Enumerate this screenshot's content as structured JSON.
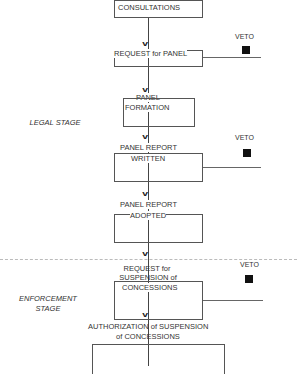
{
  "diagram": {
    "stages": [
      {
        "label": "LEGAL STAGE"
      },
      {
        "label_line1": "ENFORCEMENT",
        "label_line2": "STAGE"
      }
    ],
    "steps": [
      {
        "label": "CONSULTATIONS"
      },
      {
        "label": "REQUEST for PANEL"
      },
      {
        "label_line1": "PANEL",
        "label_line2": "FORMATION"
      },
      {
        "label_line1": "PANEL REPORT",
        "label_line2": "WRITTEN"
      },
      {
        "label_line1": "PANEL REPORT",
        "label_line2": "ADOPTED"
      },
      {
        "label_line1": "REQUEST for",
        "label_line2": "SUSPENSION of",
        "label_line3": "CONCESSIONS"
      },
      {
        "label_line1": "AUTHORIZATION of SUSPENSION",
        "label_line2": "of CONCESSIONS"
      }
    ],
    "veto_markers": [
      {
        "label": "VETO"
      },
      {
        "label": "VETO"
      },
      {
        "label": "VETO"
      }
    ],
    "arrow_glyph": "v"
  }
}
